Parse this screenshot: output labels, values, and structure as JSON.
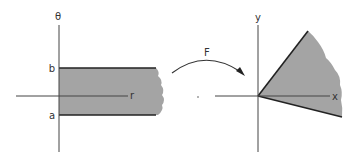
{
  "figure": {
    "colors": {
      "region_fill": "#a4a4a4",
      "boundary": "#222222",
      "axis": "#444444",
      "background": "#ffffff"
    },
    "left_panel": {
      "vertical_axis_label": "θ",
      "horizontal_axis_label": "r",
      "upper_bound_label": "b",
      "lower_bound_label": "a"
    },
    "mapping": {
      "label": "F"
    },
    "right_panel": {
      "vertical_axis_label": "y",
      "horizontal_axis_label": "x"
    }
  }
}
